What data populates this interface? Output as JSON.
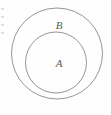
{
  "figure": {
    "type": "euler-diagram",
    "background_color": "#fefefe",
    "stroke_color": "#8a8a8a",
    "label_color": "#5a5a5a",
    "outer_circle": {
      "label": "B",
      "center_x": 57,
      "center_y": 53.5,
      "radius": 45.5
    },
    "inner_circle": {
      "label": "A",
      "center_x": 56,
      "center_y": 62.5,
      "radius": 30.5
    },
    "edge_marks": [
      8,
      16,
      24,
      32
    ]
  }
}
